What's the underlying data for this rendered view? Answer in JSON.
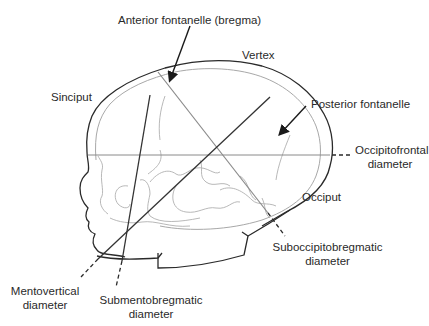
{
  "labels": {
    "anterior_fontanelle": "Anterior fontanelle (bregma)",
    "vertex": "Vertex",
    "sinciput": "Sinciput",
    "posterior_fontanelle": "Posterior fontanelle",
    "occipitofrontal_line1": "Occipitofrontal",
    "occipitofrontal_line2": "diameter",
    "occiput": "Occiput",
    "suboccipitobregmatic_line1": "Suboccipitobregmatic",
    "suboccipitobregmatic_line2": "diameter",
    "mentovertical_line1": "Mentovertical",
    "mentovertical_line2": "diameter",
    "submentobregmatic_line1": "Submentobregmatic",
    "submentobregmatic_line2": "diameter"
  },
  "colors": {
    "outline": "#2a2a2a",
    "inner_skull": "#a8a8a8",
    "diameter_dark": "#333333",
    "diameter_grey": "#8a8a8a",
    "text": "#2a2a2a"
  }
}
